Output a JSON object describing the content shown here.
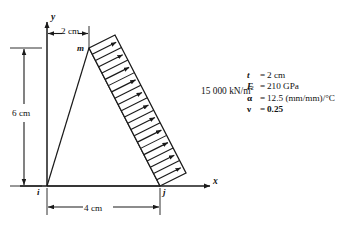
{
  "figure": {
    "title": "",
    "axes": {
      "x_label": "x",
      "y_label": "y"
    },
    "nodes": [
      {
        "id": "i",
        "label": "i"
      },
      {
        "id": "j",
        "label": "j"
      },
      {
        "id": "m",
        "label": "m"
      }
    ],
    "dimensions": {
      "top": "2 cm",
      "left": "6 cm",
      "bottom": "4 cm"
    },
    "load": {
      "label": "15 000 kN/m",
      "exponent": "2",
      "arrow_count": 11,
      "direction": "right"
    },
    "properties": [
      {
        "symbol": "t",
        "greek": false,
        "equals": "=",
        "value": "2 cm",
        "bold_value": false
      },
      {
        "symbol": "E",
        "greek": false,
        "equals": "=",
        "value": "210 GPa",
        "bold_value": false
      },
      {
        "symbol": "α",
        "greek": true,
        "equals": "=",
        "value": "12.5 (mm/mm)/°C",
        "bold_value": false
      },
      {
        "symbol": "ν",
        "greek": true,
        "equals": "=",
        "value": "0.25",
        "bold_value": true
      }
    ],
    "colors": {
      "line": "#1a1a1a",
      "background": "#ffffff",
      "text": "#111111"
    }
  }
}
